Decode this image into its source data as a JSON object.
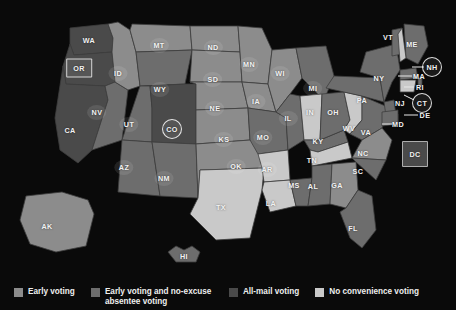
{
  "map": {
    "title": "",
    "background_color": "#0a0a0a",
    "border_color": "#4a4a4a",
    "categories": [
      {
        "key": "early",
        "label": "Early voting",
        "color": "#8c8c8c"
      },
      {
        "key": "early_absentee",
        "label": "Early voting and no-excuse absentee voting",
        "color": "#6d6d6d"
      },
      {
        "key": "all_mail",
        "label": "All-mail voting",
        "color": "#4a4a4a"
      },
      {
        "key": "none",
        "label": "No convenience voting",
        "color": "#c9c9c9"
      }
    ],
    "states": [
      {
        "code": "WA",
        "category": "all_mail",
        "x": 89,
        "y": 40,
        "style": "plain"
      },
      {
        "code": "OR",
        "category": "all_mail",
        "x": 79,
        "y": 68,
        "style": "boxed"
      },
      {
        "code": "CA",
        "category": "all_mail",
        "x": 70,
        "y": 130,
        "style": "plain"
      },
      {
        "code": "NV",
        "category": "early_absentee",
        "x": 97,
        "y": 112,
        "style": "plate"
      },
      {
        "code": "ID",
        "category": "early",
        "x": 118,
        "y": 73,
        "style": "plate"
      },
      {
        "code": "MT",
        "category": "early",
        "x": 159,
        "y": 45,
        "style": "plate"
      },
      {
        "code": "WY",
        "category": "early_absentee",
        "x": 160,
        "y": 89,
        "style": "plate"
      },
      {
        "code": "UT",
        "category": "early_absentee",
        "x": 129,
        "y": 124,
        "style": "plate"
      },
      {
        "code": "AZ",
        "category": "early_absentee",
        "x": 124,
        "y": 167,
        "style": "plate"
      },
      {
        "code": "CO",
        "category": "all_mail",
        "x": 172,
        "y": 129,
        "style": "circled"
      },
      {
        "code": "NM",
        "category": "early_absentee",
        "x": 164,
        "y": 178,
        "style": "plate"
      },
      {
        "code": "ND",
        "category": "early",
        "x": 213,
        "y": 47,
        "style": "plate"
      },
      {
        "code": "SD",
        "category": "early",
        "x": 213,
        "y": 79,
        "style": "plate"
      },
      {
        "code": "NE",
        "category": "early",
        "x": 215,
        "y": 108,
        "style": "plate"
      },
      {
        "code": "KS",
        "category": "early",
        "x": 224,
        "y": 139,
        "style": "plate"
      },
      {
        "code": "OK",
        "category": "early",
        "x": 236,
        "y": 166,
        "style": "plate"
      },
      {
        "code": "TX",
        "category": "none",
        "x": 221,
        "y": 207,
        "style": "plain"
      },
      {
        "code": "MN",
        "category": "early",
        "x": 249,
        "y": 64,
        "style": "plate"
      },
      {
        "code": "IA",
        "category": "early",
        "x": 256,
        "y": 101,
        "style": "plate"
      },
      {
        "code": "MO",
        "category": "early_absentee",
        "x": 263,
        "y": 137,
        "style": "plate"
      },
      {
        "code": "AR",
        "category": "none",
        "x": 267,
        "y": 169,
        "style": "plate"
      },
      {
        "code": "LA",
        "category": "none",
        "x": 271,
        "y": 203,
        "style": "plain"
      },
      {
        "code": "WI",
        "category": "early",
        "x": 280,
        "y": 73,
        "style": "plate"
      },
      {
        "code": "IL",
        "category": "early_absentee",
        "x": 288,
        "y": 118,
        "style": "plate"
      },
      {
        "code": "MS",
        "category": "early_absentee",
        "x": 294,
        "y": 185,
        "style": "plain"
      },
      {
        "code": "MI",
        "category": "early_absentee",
        "x": 313,
        "y": 88,
        "style": "plate"
      },
      {
        "code": "IN",
        "category": "none",
        "x": 310,
        "y": 112,
        "style": "plain"
      },
      {
        "code": "KY",
        "category": "early_absentee",
        "x": 318,
        "y": 141,
        "style": "plain"
      },
      {
        "code": "TN",
        "category": "none",
        "x": 312,
        "y": 160,
        "style": "plain"
      },
      {
        "code": "AL",
        "category": "early_absentee",
        "x": 313,
        "y": 186,
        "style": "plain"
      },
      {
        "code": "GA",
        "category": "early",
        "x": 337,
        "y": 185,
        "style": "plain"
      },
      {
        "code": "FL",
        "category": "early_absentee",
        "x": 353,
        "y": 228,
        "style": "plain"
      },
      {
        "code": "OH",
        "category": "early_absentee",
        "x": 333,
        "y": 112,
        "style": "plain"
      },
      {
        "code": "WV",
        "category": "none",
        "x": 349,
        "y": 128,
        "style": "plain"
      },
      {
        "code": "VA",
        "category": "early_absentee",
        "x": 366,
        "y": 132,
        "style": "plain"
      },
      {
        "code": "NC",
        "category": "early",
        "x": 363,
        "y": 153,
        "style": "plain"
      },
      {
        "code": "SC",
        "category": "early_absentee",
        "x": 358,
        "y": 171,
        "style": "plain"
      },
      {
        "code": "PA",
        "category": "early_absentee",
        "x": 362,
        "y": 100,
        "style": "plain"
      },
      {
        "code": "NY",
        "category": "early_absentee",
        "x": 379,
        "y": 78,
        "style": "plain"
      },
      {
        "code": "VT",
        "category": "early_absentee",
        "x": 388,
        "y": 37,
        "style": "plain"
      },
      {
        "code": "ME",
        "category": "early_absentee",
        "x": 412,
        "y": 44,
        "style": "plain"
      },
      {
        "code": "NH",
        "category": "none",
        "x": 432,
        "y": 67,
        "style": "circled"
      },
      {
        "code": "MA",
        "category": "early_absentee",
        "x": 419,
        "y": 76,
        "style": "plain"
      },
      {
        "code": "RI",
        "category": "early_absentee",
        "x": 420,
        "y": 87,
        "style": "plain"
      },
      {
        "code": "CT",
        "category": "none",
        "x": 422,
        "y": 103,
        "style": "circled"
      },
      {
        "code": "NJ",
        "category": "early_absentee",
        "x": 400,
        "y": 103,
        "style": "plain"
      },
      {
        "code": "DE",
        "category": "early_absentee",
        "x": 425,
        "y": 115,
        "style": "plain"
      },
      {
        "code": "MD",
        "category": "early_absentee",
        "x": 398,
        "y": 124,
        "style": "plain"
      },
      {
        "code": "DC",
        "category": "all_mail",
        "x": 415,
        "y": 154,
        "style": "boxed"
      },
      {
        "code": "AK",
        "category": "early",
        "x": 47,
        "y": 226,
        "style": "plain"
      },
      {
        "code": "HI",
        "category": "early_absentee",
        "x": 184,
        "y": 256,
        "style": "plain"
      }
    ]
  },
  "legend": {
    "items": [
      {
        "label": "Early voting",
        "color": "#8c8c8c"
      },
      {
        "label": "Early voting and no-excuse absentee voting",
        "color": "#6d6d6d"
      },
      {
        "label": "All-mail voting",
        "color": "#4a4a4a"
      },
      {
        "label": "No convenience voting",
        "color": "#c9c9c9"
      }
    ]
  },
  "chart_data": {
    "type": "map",
    "title": "",
    "region": "United States",
    "legend_position": "bottom",
    "categories": [
      "Early voting",
      "Early voting and no-excuse absentee voting",
      "All-mail voting",
      "No convenience voting"
    ],
    "category_colors": [
      "#8c8c8c",
      "#6d6d6d",
      "#4a4a4a",
      "#c9c9c9"
    ],
    "values": {
      "WA": "All-mail voting",
      "OR": "All-mail voting",
      "CA": "All-mail voting",
      "NV": "Early voting and no-excuse absentee voting",
      "ID": "Early voting",
      "MT": "Early voting",
      "WY": "Early voting and no-excuse absentee voting",
      "UT": "Early voting and no-excuse absentee voting",
      "AZ": "Early voting and no-excuse absentee voting",
      "CO": "All-mail voting",
      "NM": "Early voting and no-excuse absentee voting",
      "ND": "Early voting",
      "SD": "Early voting",
      "NE": "Early voting",
      "KS": "Early voting",
      "OK": "Early voting",
      "TX": "No convenience voting",
      "MN": "Early voting",
      "IA": "Early voting",
      "MO": "Early voting and no-excuse absentee voting",
      "AR": "No convenience voting",
      "LA": "No convenience voting",
      "WI": "Early voting",
      "IL": "Early voting and no-excuse absentee voting",
      "MS": "Early voting and no-excuse absentee voting",
      "MI": "Early voting and no-excuse absentee voting",
      "IN": "No convenience voting",
      "KY": "Early voting and no-excuse absentee voting",
      "TN": "No convenience voting",
      "AL": "Early voting and no-excuse absentee voting",
      "GA": "Early voting",
      "FL": "Early voting and no-excuse absentee voting",
      "OH": "Early voting and no-excuse absentee voting",
      "WV": "No convenience voting",
      "VA": "Early voting and no-excuse absentee voting",
      "NC": "Early voting",
      "SC": "Early voting and no-excuse absentee voting",
      "PA": "Early voting and no-excuse absentee voting",
      "NY": "Early voting and no-excuse absentee voting",
      "VT": "Early voting and no-excuse absentee voting",
      "ME": "Early voting and no-excuse absentee voting",
      "NH": "No convenience voting",
      "MA": "Early voting and no-excuse absentee voting",
      "RI": "Early voting and no-excuse absentee voting",
      "CT": "No convenience voting",
      "NJ": "Early voting and no-excuse absentee voting",
      "DE": "Early voting and no-excuse absentee voting",
      "MD": "Early voting and no-excuse absentee voting",
      "DC": "All-mail voting",
      "AK": "Early voting",
      "HI": "Early voting and no-excuse absentee voting"
    },
    "highlighted": [
      "OR",
      "CO",
      "NH",
      "CT",
      "DC"
    ]
  }
}
